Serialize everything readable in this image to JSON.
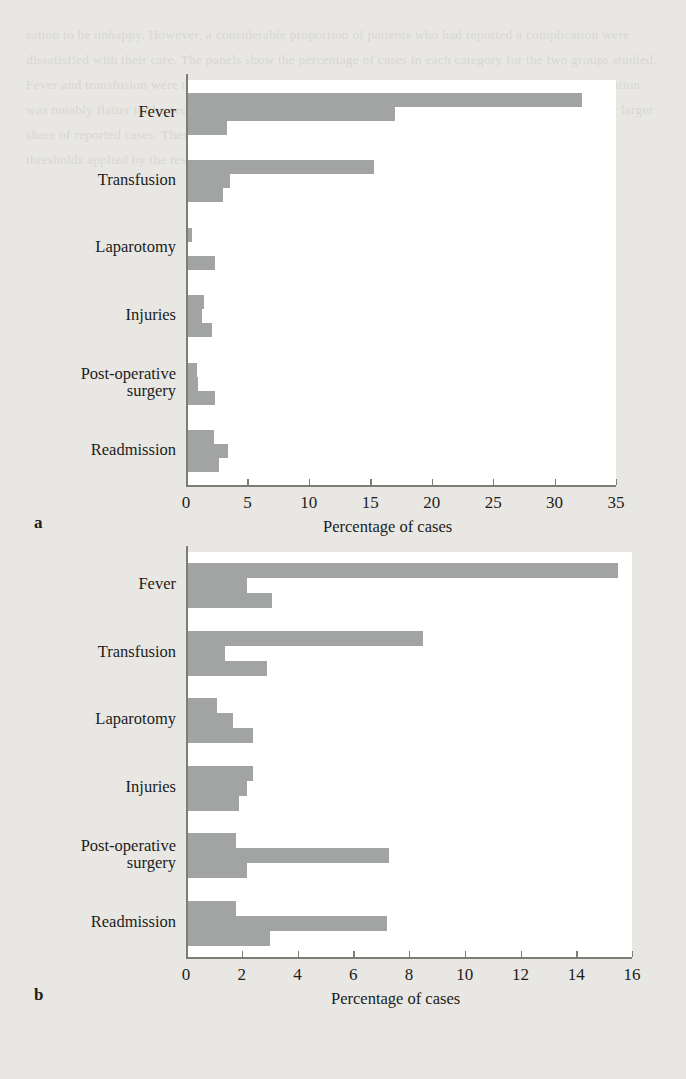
{
  "page": {
    "background_color": "#e8e7e3",
    "bar_color": "#a2a4a3",
    "plot_background": "#ffffff",
    "axis_color": "#7d7d78",
    "bleed_text": "sation to be unhappy. However, a considerable proportion of patients who had reported a complication were dissatisfied with their care. The panels show the percentage of cases in each category for the two groups studied. Fever and transfusion were the most frequently encountered events in the first group, whereas the distribution was notably flatter in the second group, where post-operative surgery and readmission accounted for a far larger share of reported cases. These differences may reflect variation in case mix as well as differences in the thresholds applied by the reviewing clinicians when classifying events."
  },
  "chart_data": [
    {
      "panel": "a",
      "type": "bar",
      "orientation": "horizontal",
      "title": "",
      "xlabel": "Percentage of cases",
      "ylabel": "",
      "xlim": [
        0,
        35
      ],
      "xticks": [
        0,
        5,
        10,
        15,
        20,
        25,
        30,
        35
      ],
      "grid": false,
      "legend": "none",
      "categories": [
        "Fever",
        "Transfusion",
        "Laparotomy",
        "Injuries",
        "Post-operative\nsurgery",
        "Readmission"
      ],
      "series": [
        {
          "name": "series-1",
          "values": [
            32.2,
            15.3,
            0.5,
            1.5,
            0.9,
            2.3
          ]
        },
        {
          "name": "series-2",
          "values": [
            17.0,
            3.6,
            0.0,
            1.3,
            1.0,
            3.4
          ]
        },
        {
          "name": "series-3",
          "values": [
            3.3,
            3.0,
            2.4,
            2.1,
            2.4,
            2.7
          ]
        }
      ]
    },
    {
      "panel": "b",
      "type": "bar",
      "orientation": "horizontal",
      "title": "",
      "xlabel": "Percentage of cases",
      "ylabel": "",
      "xlim": [
        0,
        16
      ],
      "xticks": [
        0,
        2,
        4,
        6,
        8,
        10,
        12,
        14,
        16
      ],
      "grid": false,
      "legend": "none",
      "categories": [
        "Fever",
        "Transfusion",
        "Laparotomy",
        "Injuries",
        "Post-operative\nsurgery",
        "Readmission"
      ],
      "series": [
        {
          "name": "series-1",
          "values": [
            15.5,
            8.5,
            1.1,
            2.4,
            1.8,
            1.8
          ]
        },
        {
          "name": "series-2",
          "values": [
            2.2,
            1.4,
            1.7,
            2.2,
            7.3,
            7.2
          ]
        },
        {
          "name": "series-3",
          "values": [
            3.1,
            2.9,
            2.4,
            1.9,
            2.2,
            3.0
          ]
        }
      ]
    }
  ],
  "panel_a": {
    "letter": "a",
    "xlabel": "Percentage of cases",
    "xticks": [
      "0",
      "5",
      "10",
      "15",
      "20",
      "25",
      "30",
      "35"
    ],
    "categories": [
      "Fever",
      "Transfusion",
      "Laparotomy",
      "Injuries",
      "Post-operative\nsurgery",
      "Readmission"
    ]
  },
  "panel_b": {
    "letter": "b",
    "xlabel": "Percentage of cases",
    "xticks": [
      "0",
      "2",
      "4",
      "6",
      "8",
      "10",
      "12",
      "14",
      "16"
    ],
    "categories": [
      "Fever",
      "Transfusion",
      "Laparotomy",
      "Injuries",
      "Post-operative\nsurgery",
      "Readmission"
    ]
  }
}
